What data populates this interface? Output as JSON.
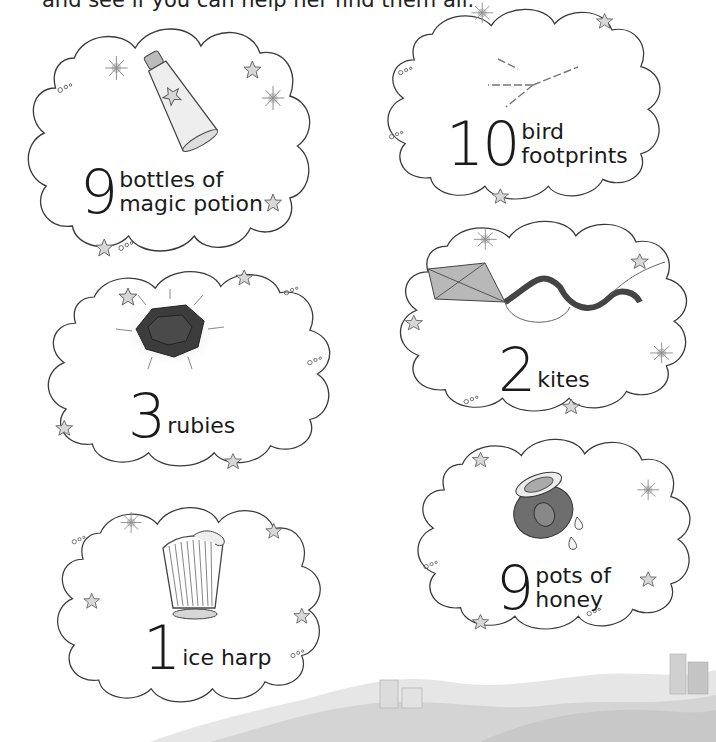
{
  "page": {
    "intro_text": "and see if you can help her find them all.",
    "colors": {
      "ink": "#1a1a1a",
      "outline": "#3a3a3a",
      "star_fill": "#d8d8d8",
      "sparkle": "#9a9a9a",
      "gem": "#3c3c3c",
      "landscape": "#cfcfcf"
    }
  },
  "items": [
    {
      "id": "potion",
      "count": "9",
      "line1": "bottles of",
      "line2": "magic potion",
      "icon": "potion-bottle-icon"
    },
    {
      "id": "footprints",
      "count": "10",
      "line1": "bird",
      "line2": "footprints",
      "icon": "bird-footprint-icon"
    },
    {
      "id": "rubies",
      "count": "3",
      "line1": "",
      "line2": "rubies",
      "icon": "ruby-gem-icon"
    },
    {
      "id": "kites",
      "count": "2",
      "line1": "",
      "line2": "kites",
      "icon": "kite-icon"
    },
    {
      "id": "harp",
      "count": "1",
      "line1": "",
      "line2": "ice harp",
      "icon": "harp-icon"
    },
    {
      "id": "honey",
      "count": "9",
      "line1": "pots of",
      "line2": "honey",
      "icon": "honey-pot-icon"
    }
  ]
}
